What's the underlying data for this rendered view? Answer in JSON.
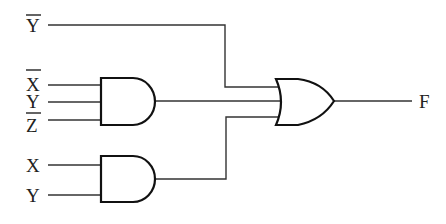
{
  "diagram": {
    "type": "logic-circuit",
    "inputs": [
      {
        "id": "in_ybar_top",
        "label": "Y",
        "negated": true
      },
      {
        "id": "in_xbar",
        "label": "X",
        "negated": true
      },
      {
        "id": "in_y1",
        "label": "Y",
        "negated": false
      },
      {
        "id": "in_zbar",
        "label": "Z",
        "negated": true
      },
      {
        "id": "in_x",
        "label": "X",
        "negated": false
      },
      {
        "id": "in_y2",
        "label": "Y",
        "negated": false
      }
    ],
    "gates": [
      {
        "id": "and1",
        "type": "AND",
        "inputs": [
          "X̄",
          "Y",
          "Z̄"
        ]
      },
      {
        "id": "and2",
        "type": "AND",
        "inputs": [
          "X",
          "Y"
        ]
      },
      {
        "id": "or1",
        "type": "OR",
        "inputs": [
          "Ȳ",
          "and1",
          "and2"
        ]
      }
    ],
    "output": {
      "label": "F"
    },
    "expression": "F = Ȳ + X̄YZ̄ + XY"
  }
}
